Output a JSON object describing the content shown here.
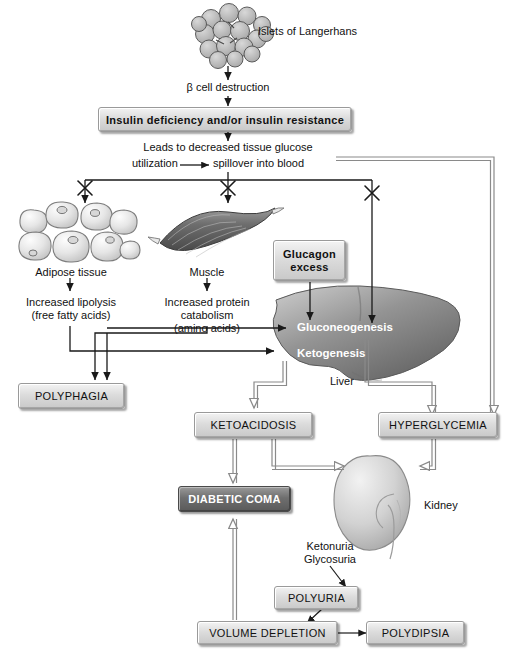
{
  "diagram": {
    "labels": {
      "islets": "Islets of Langerhans",
      "beta_cell": "β cell destruction",
      "leads_line1": "Leads to decreased tissue glucose",
      "leads_line2a": "utilization",
      "leads_line2b": "spillover into blood",
      "adipose": "Adipose tissue",
      "lipolysis_1": "Increased lipolysis",
      "lipolysis_2": "(free fatty acids)",
      "muscle": "Muscle",
      "catabolism_1": "Increased protein",
      "catabolism_2": "catabolism",
      "catabolism_3": "(amino acids)",
      "gluconeogenesis": "Gluconeogenesis",
      "ketogenesis": "Ketogenesis",
      "liver": "Liver",
      "kidney": "Kidney",
      "ketonuria": "Ketonuria",
      "glycosuria": "Glycosuria"
    },
    "boxes": {
      "insulin_deficiency": "Insulin deficiency and/or insulin resistance",
      "glucagon_line1": "Glucagon",
      "glucagon_line2": "excess",
      "polyphagia": "POLYPHAGIA",
      "ketoacidosis": "KETOACIDOSIS",
      "hyperglycemia": "HYPERGLYCEMIA",
      "diabetic_coma": "DIABETIC COMA",
      "polyuria": "POLYURIA",
      "volume_depletion": "VOLUME DEPLETION",
      "polydipsia": "POLYDIPSIA"
    },
    "colors": {
      "box_face": "#dcdcdc",
      "box_border": "#9a9a9a",
      "dark_box_face": "#6f6f6f",
      "dark_box_text": "#ffffff",
      "black_arrow": "#1a1a1a",
      "gray_arrow": "#8a8a8a",
      "organ_fill": "#bfbfbf",
      "liver_fill": "#8f8f8f",
      "page_bg": "#ffffff"
    }
  }
}
